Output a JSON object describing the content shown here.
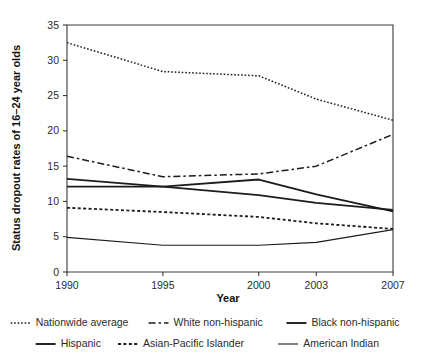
{
  "chart_data": {
    "type": "line",
    "title": "",
    "xlabel": "Year",
    "ylabel": "Status dropout rates of 16–24 year olds",
    "categories": [
      "1990",
      "1995",
      "2000",
      "2003",
      "2007"
    ],
    "x": [
      1990,
      1995,
      2000,
      2003,
      2007
    ],
    "xlim": [
      1990,
      2007
    ],
    "ylim": [
      0,
      35
    ],
    "yticks": [
      0,
      5,
      10,
      15,
      20,
      25,
      30,
      35
    ],
    "ytick_labels": [
      "0",
      "5",
      "10",
      "15",
      "20",
      "25",
      "30",
      "35"
    ],
    "xticks": [
      1990,
      1995,
      2000,
      2003,
      2007
    ],
    "xtick_labels": [
      "1990",
      "1995",
      "2000",
      "2003",
      "2007"
    ],
    "grid": false,
    "legend_position": "bottom",
    "series": [
      {
        "name": "Nationwide average",
        "style": "dotted",
        "dash": "1.6,1.9",
        "width": 1.5,
        "color": "#1c1c1c",
        "values": [
          32.5,
          28.4,
          27.8,
          24.5,
          21.5
        ]
      },
      {
        "name": "White non-hispanic",
        "style": "dash-dot",
        "dash": "7,3,2.5,3",
        "width": 1.5,
        "color": "#1c1c1c",
        "values": [
          16.4,
          13.5,
          13.9,
          15.0,
          19.5
        ]
      },
      {
        "name": "Black non-hispanic",
        "style": "solid-thick",
        "dash": "none",
        "width": 1.9,
        "color": "#1c1c1c",
        "values": [
          13.2,
          12.1,
          13.1,
          11.0,
          8.6
        ]
      },
      {
        "name": "Hispanic",
        "style": "solid-thick",
        "dash": "none",
        "width": 1.9,
        "color": "#1c1c1c",
        "values": [
          12.1,
          12.1,
          10.9,
          9.8,
          8.8
        ]
      },
      {
        "name": "Asian-Pacific Islander",
        "style": "dotted-coarse",
        "dash": "3,2.4",
        "width": 1.8,
        "color": "#1c1c1c",
        "values": [
          9.1,
          8.5,
          7.8,
          6.9,
          6.1
        ]
      },
      {
        "name": "American Indian",
        "style": "solid-thin",
        "dash": "none",
        "width": 1.1,
        "color": "#4a4a4a",
        "values": [
          4.9,
          3.8,
          3.8,
          4.2,
          6.0
        ]
      }
    ],
    "legend_rows": [
      [
        "Nationwide average",
        "White non-hispanic",
        "Black non-hispanic"
      ],
      [
        "Hispanic",
        "Asian-Pacific Islander",
        "American Indian"
      ]
    ]
  },
  "axis": {
    "y_title": "Status dropout rates of 16–24 year olds",
    "x_title": "Year"
  }
}
